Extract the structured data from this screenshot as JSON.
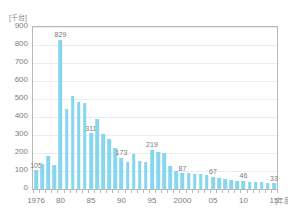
{
  "chart_data": {
    "type": "bar",
    "title": "",
    "subtitle": "",
    "xlabel": "[年度]",
    "ylabel": "[千台]",
    "yunit_label": "[千台]",
    "xunit_label": "[年度]",
    "ylim": [
      0,
      900
    ],
    "ytick_step": 100,
    "grid": true,
    "legend": "none",
    "bar_color": "#86d6ef",
    "frame_color": "#b9b9b9",
    "grid_color": "#ececec",
    "text_color": "#7d7d7d",
    "yticks": [
      "900",
      "800",
      "700",
      "600",
      "500",
      "400",
      "300",
      "200",
      "100",
      "0"
    ],
    "ytick_values": [
      900,
      800,
      700,
      600,
      500,
      400,
      300,
      200,
      100,
      0
    ],
    "xtick_labels": [
      "1976",
      "80",
      "85",
      "90",
      "95",
      "2000",
      "05",
      "10",
      "15"
    ],
    "xtick_years": [
      1976,
      1980,
      1985,
      1990,
      1995,
      2000,
      2005,
      2010,
      2015
    ],
    "categories": [
      "1976",
      "1977",
      "1978",
      "1979",
      "1980",
      "1981",
      "1982",
      "1983",
      "1984",
      "1985",
      "1986",
      "1987",
      "1988",
      "1989",
      "1990",
      "1991",
      "1992",
      "1993",
      "1994",
      "1995",
      "1996",
      "1997",
      "1998",
      "1999",
      "2000",
      "2001",
      "2002",
      "2003",
      "2004",
      "2005",
      "2006",
      "2007",
      "2008",
      "2009",
      "2010",
      "2011",
      "2012",
      "2013",
      "2014",
      "2015"
    ],
    "values": [
      105,
      140,
      186,
      136,
      829,
      447,
      516,
      483,
      477,
      311,
      390,
      304,
      277,
      226,
      173,
      152,
      196,
      158,
      151,
      219,
      206,
      201,
      130,
      101,
      87,
      90,
      83,
      84,
      78,
      67,
      62,
      57,
      50,
      46,
      46,
      41,
      38,
      37,
      36,
      33
    ],
    "point_labels": [
      {
        "category": "1976",
        "value": 105,
        "text": "105"
      },
      {
        "category": "1980",
        "value": 829,
        "text": "829"
      },
      {
        "category": "1985",
        "value": 311,
        "text": "311"
      },
      {
        "category": "1990",
        "value": 173,
        "text": "173"
      },
      {
        "category": "1995",
        "value": 219,
        "text": "219"
      },
      {
        "category": "2000",
        "value": 87,
        "text": "87"
      },
      {
        "category": "2005",
        "value": 67,
        "text": "67"
      },
      {
        "category": "2010",
        "value": 46,
        "text": "46"
      },
      {
        "category": "2015",
        "value": 33,
        "text": "33"
      }
    ]
  }
}
